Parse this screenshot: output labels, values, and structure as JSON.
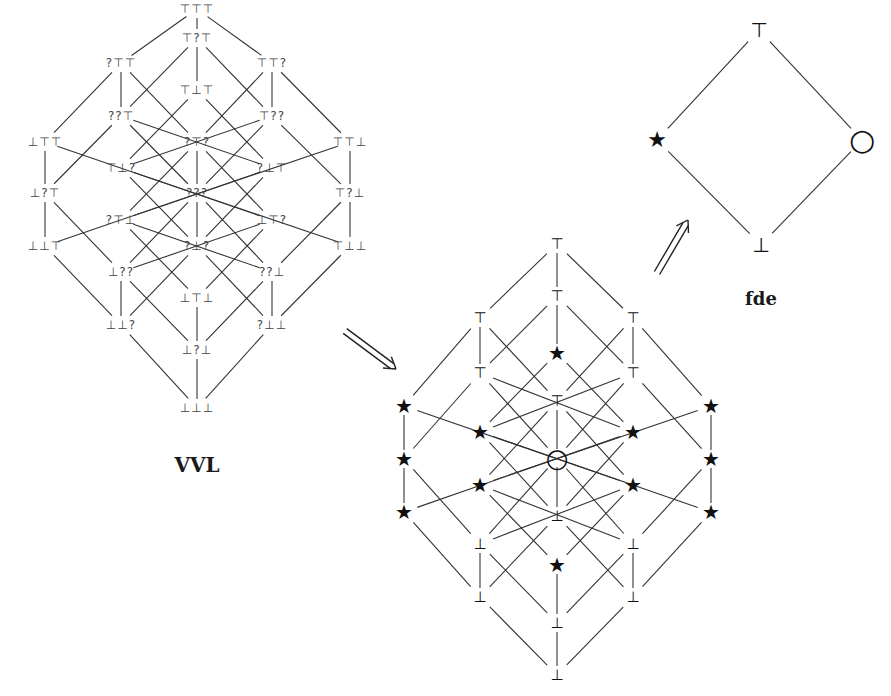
{
  "vvl": {
    "caption": "VVL",
    "nodes": [
      {
        "id": "TTT",
        "label": "⊤⊤⊤",
        "x": 197,
        "y": 9
      },
      {
        "id": "T?T",
        "label": "⊤?⊤",
        "x": 197,
        "y": 38
      },
      {
        "id": "?TT",
        "label": "?⊤⊤",
        "x": 121,
        "y": 63
      },
      {
        "id": "TT?",
        "label": "⊤⊤?",
        "x": 272,
        "y": 63
      },
      {
        "id": "TBT",
        "label": "⊤⊥⊤",
        "x": 197,
        "y": 90
      },
      {
        "id": "??T",
        "label": "??⊤",
        "x": 121,
        "y": 116
      },
      {
        "id": "T??",
        "label": "⊤??",
        "x": 272,
        "y": 116
      },
      {
        "id": "BTT",
        "label": "⊥⊤⊤",
        "x": 45,
        "y": 142
      },
      {
        "id": "?T?",
        "label": "?⊤?",
        "x": 197,
        "y": 142
      },
      {
        "id": "TTB",
        "label": "⊤⊤⊥",
        "x": 350,
        "y": 142
      },
      {
        "id": "TB?",
        "label": "⊤⊥?",
        "x": 121,
        "y": 168
      },
      {
        "id": "?BT",
        "label": "?⊥⊤",
        "x": 272,
        "y": 168
      },
      {
        "id": "B?T",
        "label": "⊥?⊤",
        "x": 45,
        "y": 193
      },
      {
        "id": "???",
        "label": "???",
        "x": 197,
        "y": 193
      },
      {
        "id": "T?B",
        "label": "⊤?⊥",
        "x": 350,
        "y": 193
      },
      {
        "id": "?TB",
        "label": "?⊤⊥",
        "x": 121,
        "y": 220
      },
      {
        "id": "BT?",
        "label": "⊥⊤?",
        "x": 272,
        "y": 220
      },
      {
        "id": "BBT",
        "label": "⊥⊥⊤",
        "x": 45,
        "y": 246
      },
      {
        "id": "?B?",
        "label": "?⊥?",
        "x": 197,
        "y": 246
      },
      {
        "id": "TBB",
        "label": "⊤⊥⊥",
        "x": 350,
        "y": 246
      },
      {
        "id": "B??",
        "label": "⊥??",
        "x": 121,
        "y": 272
      },
      {
        "id": "??B",
        "label": "??⊥",
        "x": 272,
        "y": 272
      },
      {
        "id": "BTB",
        "label": "⊥⊤⊥",
        "x": 197,
        "y": 298
      },
      {
        "id": "BB?",
        "label": "⊥⊥?",
        "x": 121,
        "y": 325
      },
      {
        "id": "?BB",
        "label": "?⊥⊥",
        "x": 272,
        "y": 325
      },
      {
        "id": "B?B",
        "label": "⊥?⊥",
        "x": 197,
        "y": 350
      },
      {
        "id": "BBB",
        "label": "⊥⊥⊥",
        "x": 197,
        "y": 408
      }
    ],
    "caption_pos": {
      "x": 197,
      "y": 465
    }
  },
  "mapped": {
    "nodes": [
      {
        "id": "TTT",
        "sym": "⊤",
        "x": 557,
        "y": 244
      },
      {
        "id": "T?T",
        "sym": "⊤",
        "x": 557,
        "y": 296
      },
      {
        "id": "?TT",
        "sym": "⊤",
        "x": 480,
        "y": 318
      },
      {
        "id": "TT?",
        "sym": "⊤",
        "x": 633,
        "y": 318
      },
      {
        "id": "TBT",
        "sym": "★",
        "x": 557,
        "y": 353
      },
      {
        "id": "??T",
        "sym": "⊤",
        "x": 480,
        "y": 373
      },
      {
        "id": "T??",
        "sym": "⊤",
        "x": 633,
        "y": 373
      },
      {
        "id": "BTT",
        "sym": "★",
        "x": 404,
        "y": 406
      },
      {
        "id": "?T?",
        "sym": "⊤",
        "x": 557,
        "y": 401
      },
      {
        "id": "TTB",
        "sym": "★",
        "x": 711,
        "y": 406
      },
      {
        "id": "TB?",
        "sym": "★",
        "x": 480,
        "y": 432
      },
      {
        "id": "?BT",
        "sym": "★",
        "x": 633,
        "y": 432
      },
      {
        "id": "B?T",
        "sym": "★",
        "x": 404,
        "y": 459
      },
      {
        "id": "???",
        "sym": "○",
        "x": 557,
        "y": 458
      },
      {
        "id": "T?B",
        "sym": "★",
        "x": 711,
        "y": 459
      },
      {
        "id": "?TB",
        "sym": "★",
        "x": 480,
        "y": 485
      },
      {
        "id": "BT?",
        "sym": "★",
        "x": 633,
        "y": 485
      },
      {
        "id": "BBT",
        "sym": "★",
        "x": 404,
        "y": 512
      },
      {
        "id": "?B?",
        "sym": "⊥",
        "x": 557,
        "y": 516
      },
      {
        "id": "TBB",
        "sym": "★",
        "x": 711,
        "y": 512
      },
      {
        "id": "B??",
        "sym": "⊥",
        "x": 480,
        "y": 544
      },
      {
        "id": "??B",
        "sym": "⊥",
        "x": 633,
        "y": 544
      },
      {
        "id": "BTB",
        "sym": "★",
        "x": 557,
        "y": 565
      },
      {
        "id": "BB?",
        "sym": "⊥",
        "x": 480,
        "y": 597
      },
      {
        "id": "?BB",
        "sym": "⊥",
        "x": 633,
        "y": 597
      },
      {
        "id": "B?B",
        "sym": "⊥",
        "x": 557,
        "y": 623
      },
      {
        "id": "BBB",
        "sym": "⊥",
        "x": 557,
        "y": 675
      }
    ]
  },
  "fde": {
    "caption": "fde",
    "caption_pos": {
      "x": 761,
      "y": 298
    },
    "nodes": [
      {
        "id": "top",
        "sym": "⊤",
        "x": 759,
        "y": 30
      },
      {
        "id": "star",
        "sym": "★",
        "x": 657,
        "y": 140
      },
      {
        "id": "circle",
        "sym": "○",
        "x": 862,
        "y": 140
      },
      {
        "id": "bottom",
        "sym": "⊥",
        "x": 761,
        "y": 245
      }
    ],
    "edges": [
      [
        "top",
        "star"
      ],
      [
        "top",
        "circle"
      ],
      [
        "star",
        "bottom"
      ],
      [
        "circle",
        "bottom"
      ]
    ]
  },
  "edges_vvl": [
    [
      "TTT",
      "T?T"
    ],
    [
      "TTT",
      "?TT"
    ],
    [
      "TTT",
      "TT?"
    ],
    [
      "T?T",
      "??T"
    ],
    [
      "T?T",
      "TBT"
    ],
    [
      "T?T",
      "T??"
    ],
    [
      "?TT",
      "BTT"
    ],
    [
      "?TT",
      "??T"
    ],
    [
      "?TT",
      "?T?"
    ],
    [
      "TT?",
      "?T?"
    ],
    [
      "TT?",
      "T??"
    ],
    [
      "TT?",
      "TTB"
    ],
    [
      "TBT",
      "TB?"
    ],
    [
      "TBT",
      "?BT"
    ],
    [
      "??T",
      "B?T"
    ],
    [
      "??T",
      "?BT"
    ],
    [
      "??T",
      "???"
    ],
    [
      "T??",
      "TB?"
    ],
    [
      "T??",
      "???"
    ],
    [
      "T??",
      "T?B"
    ],
    [
      "BTT",
      "B?T"
    ],
    [
      "BTT",
      "BT?"
    ],
    [
      "?T?",
      "BT?"
    ],
    [
      "?T?",
      "???"
    ],
    [
      "?T?",
      "?TB"
    ],
    [
      "TTB",
      "?TB"
    ],
    [
      "TTB",
      "T?B"
    ],
    [
      "TB?",
      "?B?"
    ],
    [
      "TB?",
      "TBB"
    ],
    [
      "?BT",
      "BBT"
    ],
    [
      "?BT",
      "?B?"
    ],
    [
      "B?T",
      "BBT"
    ],
    [
      "B?T",
      "B??"
    ],
    [
      "???",
      "B??"
    ],
    [
      "???",
      "?B?"
    ],
    [
      "???",
      "??B"
    ],
    [
      "T?B",
      "??B"
    ],
    [
      "T?B",
      "TBB"
    ],
    [
      "?TB",
      "BTB"
    ],
    [
      "?TB",
      "??B"
    ],
    [
      "BT?",
      "B??"
    ],
    [
      "BT?",
      "BTB"
    ],
    [
      "BBT",
      "BB?"
    ],
    [
      "?B?",
      "BB?"
    ],
    [
      "?B?",
      "?BB"
    ],
    [
      "TBB",
      "?BB"
    ],
    [
      "B??",
      "BB?"
    ],
    [
      "B??",
      "B?B"
    ],
    [
      "??B",
      "?BB"
    ],
    [
      "??B",
      "B?B"
    ],
    [
      "BTB",
      "B?B"
    ],
    [
      "BB?",
      "BBB"
    ],
    [
      "?BB",
      "BBB"
    ],
    [
      "B?B",
      "BBB"
    ]
  ],
  "arrows": [
    {
      "name": "vvl-to-mapped-arrow",
      "from": {
        "x": 345,
        "y": 331
      },
      "to": {
        "x": 396,
        "y": 369
      }
    },
    {
      "name": "mapped-to-fde-arrow",
      "from": {
        "x": 657,
        "y": 273
      },
      "to": {
        "x": 688,
        "y": 220
      }
    }
  ],
  "colors": {
    "line": "#333333",
    "text": "#444444",
    "background": "#ffffff"
  }
}
